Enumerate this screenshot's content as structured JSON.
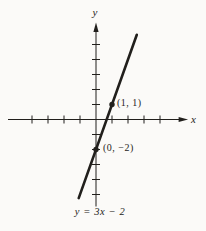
{
  "figure": {
    "background": "#fbfaf8",
    "ink_color": "#211f1c",
    "caption": "y = 3x − 2"
  },
  "chart_data": {
    "type": "line",
    "title": "",
    "equation": "y = 3x − 2",
    "slope": 3,
    "intercept": -2,
    "xlabel": "x",
    "ylabel": "y",
    "points": [
      {
        "x": 1,
        "y": 1,
        "label": "(1, 1)"
      },
      {
        "x": 0,
        "y": -2,
        "label": "(0, −2)"
      }
    ],
    "line_extent_x": [
      -1.08,
      2.55
    ],
    "x_ticks": [
      -4,
      -3,
      -2,
      -1,
      1,
      2,
      3,
      4
    ],
    "y_ticks": [
      -5,
      -4,
      -3,
      -2,
      -1,
      1,
      2,
      3,
      4,
      5
    ],
    "x_axis_range": [
      -5.5,
      5.6
    ],
    "y_axis_range": [
      -5.8,
      6.3
    ],
    "grid": false,
    "legend": null
  }
}
